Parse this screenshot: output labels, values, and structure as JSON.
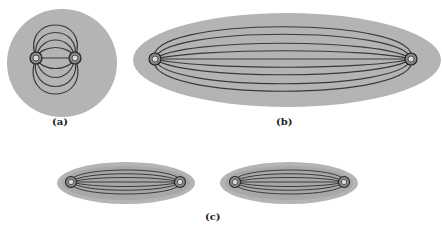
{
  "figure": {
    "colors": {
      "region_fill": "#b4b4b4",
      "region_inner": "#a8a8a8",
      "line": "#3a3a3a",
      "endpoint_fill": "#8a8a8a",
      "background": "#ffffff"
    },
    "panels": [
      {
        "id": "a",
        "label": "(a)",
        "shape": "circle",
        "endpoint_label": "G",
        "field_lines": 9
      },
      {
        "id": "b",
        "label": "(b)",
        "shape": "long-ellipse",
        "endpoint_label": "G",
        "field_lines": 9
      },
      {
        "id": "c",
        "label": "(c)",
        "shape": "two-small-ellipses",
        "endpoint_label": "G",
        "field_lines": 9
      }
    ]
  }
}
